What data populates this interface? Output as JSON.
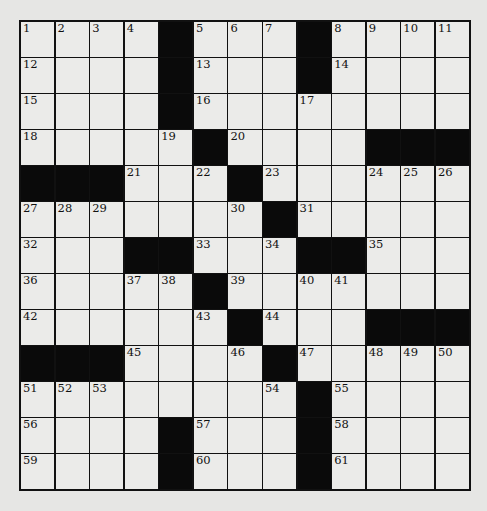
{
  "puzzle": {
    "rows": 13,
    "cols": 13,
    "layout": [
      "....#...#....",
      "....#...#....",
      "....#........",
      ".....#....###",
      "###...#......",
      ".......#.....",
      "...##...##...",
      ".....#.......",
      "......#...###",
      "###....#.....",
      "........#....",
      "....#...#....",
      "....#...#...."
    ],
    "numbers": [
      [
        1,
        2,
        3,
        4,
        0,
        5,
        6,
        7,
        0,
        8,
        9,
        10,
        11
      ],
      [
        12,
        0,
        0,
        0,
        0,
        13,
        0,
        0,
        0,
        14,
        0,
        0,
        0
      ],
      [
        15,
        0,
        0,
        0,
        0,
        16,
        0,
        0,
        17,
        0,
        0,
        0,
        0
      ],
      [
        18,
        0,
        0,
        0,
        19,
        0,
        20,
        0,
        0,
        0,
        0,
        0,
        0
      ],
      [
        0,
        0,
        0,
        21,
        0,
        22,
        0,
        23,
        0,
        0,
        24,
        25,
        26
      ],
      [
        27,
        28,
        29,
        0,
        0,
        0,
        30,
        0,
        31,
        0,
        0,
        0,
        0
      ],
      [
        32,
        0,
        0,
        0,
        0,
        33,
        0,
        34,
        0,
        0,
        35,
        0,
        0
      ],
      [
        36,
        0,
        0,
        37,
        38,
        0,
        39,
        0,
        40,
        41,
        0,
        0,
        0
      ],
      [
        42,
        0,
        0,
        0,
        0,
        43,
        0,
        44,
        0,
        0,
        0,
        0,
        0
      ],
      [
        0,
        0,
        0,
        45,
        0,
        0,
        46,
        0,
        47,
        0,
        48,
        49,
        50
      ],
      [
        51,
        52,
        53,
        0,
        0,
        0,
        0,
        54,
        0,
        55,
        0,
        0,
        0
      ],
      [
        56,
        0,
        0,
        0,
        0,
        57,
        0,
        0,
        0,
        58,
        0,
        0,
        0
      ],
      [
        59,
        0,
        0,
        0,
        0,
        60,
        0,
        0,
        0,
        61,
        0,
        0,
        0
      ]
    ],
    "colors": {
      "black_square": "#0a0a0a",
      "white_square": "#ebebe9",
      "grid_line": "#111111",
      "background": "#e6e6e4"
    }
  }
}
